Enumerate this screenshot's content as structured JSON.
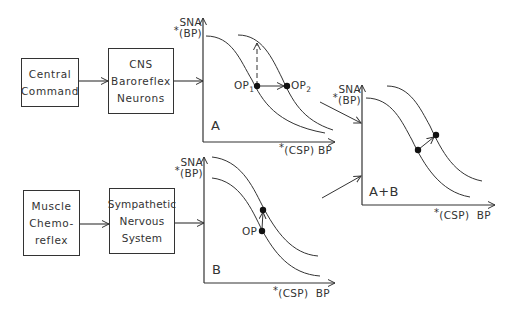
{
  "blocks": {
    "central_command": [
      "Central",
      "Command"
    ],
    "cns_baroreflex": [
      "CNS",
      "Baroreflex",
      "Neurons"
    ],
    "muscle_chemoreflex": [
      "Muscle",
      "Chemo-",
      "reflex"
    ],
    "sympathetic": [
      "Sympathetic",
      "Nervous",
      "System"
    ]
  },
  "axes": {
    "y_label_line1": "SNA",
    "y_label_line2": "(BP)",
    "asterisk": "*",
    "x_label_csp": "(CSP)",
    "x_label_bp": "BP"
  },
  "panels": {
    "a": {
      "label": "A",
      "op1": "OP",
      "op1_sub": "1",
      "op2": "OP",
      "op2_sub": "2"
    },
    "b": {
      "label": "B",
      "op": "OP"
    },
    "ab": {
      "label": "A+B"
    }
  },
  "colors": {
    "stroke": "#333333",
    "background": "#ffffff"
  }
}
